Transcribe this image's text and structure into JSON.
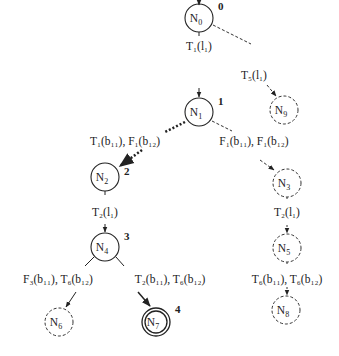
{
  "nodes": [
    {
      "id": "N0",
      "label": "N",
      "sub": "0",
      "step": "0",
      "style": "solid",
      "cx": 199,
      "cy": 18
    },
    {
      "id": "N1",
      "label": "N",
      "sub": "1",
      "step": "1",
      "style": "solid",
      "cx": 199,
      "cy": 112
    },
    {
      "id": "N9",
      "label": "N",
      "sub": "9",
      "step": "",
      "style": "dashed",
      "cx": 284,
      "cy": 110
    },
    {
      "id": "N2",
      "label": "N",
      "sub": "2",
      "step": "2",
      "style": "solid",
      "cx": 105,
      "cy": 177
    },
    {
      "id": "N3",
      "label": "N",
      "sub": "3",
      "step": "",
      "style": "dashed",
      "cx": 287,
      "cy": 183
    },
    {
      "id": "N4",
      "label": "N",
      "sub": "4",
      "step": "3",
      "style": "solid",
      "cx": 105,
      "cy": 247
    },
    {
      "id": "N5",
      "label": "N",
      "sub": "5",
      "step": "",
      "style": "dashed",
      "cx": 287,
      "cy": 248
    },
    {
      "id": "N6",
      "label": "N",
      "sub": "6",
      "step": "",
      "style": "dashed",
      "cx": 59,
      "cy": 322
    },
    {
      "id": "N7",
      "label": "N",
      "sub": "7",
      "step": "4",
      "style": "double",
      "cx": 156,
      "cy": 322
    },
    {
      "id": "N8",
      "label": "N",
      "sub": "8",
      "step": "",
      "style": "dashed",
      "cx": 286,
      "cy": 310
    }
  ],
  "edges": [
    {
      "from": "N0",
      "to": "N1",
      "style": "solid",
      "label": "T₁(l₁)"
    },
    {
      "from": "N0",
      "to": "N9",
      "style": "dashed",
      "label": "T₅(l₁)"
    },
    {
      "from": "N1",
      "to": "N2",
      "style": "dotted",
      "label": "T₁(b₁₁), F₁(b₁₂)"
    },
    {
      "from": "N1",
      "to": "N3",
      "style": "dashed",
      "label": "F₁(b₁₁), F₁(b₁₂)"
    },
    {
      "from": "N2",
      "to": "N4",
      "style": "solid",
      "label": "T₂(l₁)"
    },
    {
      "from": "N3",
      "to": "N5",
      "style": "dashed",
      "label": "T₂(l₁)"
    },
    {
      "from": "N4",
      "to": "N6",
      "style": "solid",
      "label": "F₃(b₁₁), T₆(b₁₂)"
    },
    {
      "from": "N4",
      "to": "N7",
      "style": "solid",
      "label": "T₂(b₁₁), T₆(b₁₂)"
    },
    {
      "from": "N5",
      "to": "N8",
      "style": "dashed",
      "label": "T₆(b₁₁), T₆(b₁₂)"
    }
  ],
  "labels": {
    "e01": "T₁(l₁)",
    "e09": "T₅(l₁)",
    "e12": "T₁(b₁₁), F₁(b₁₂)",
    "e13": "F₁(b₁₁), F₁(b₁₂)",
    "e24": "T₂(l₁)",
    "e35": "T₂(l₁)",
    "e46": "F₃(b₁₁), T₆(b₁₂)",
    "e47": "T₂(b₁₁), T₆(b₁₂)",
    "e58": "T₆(b₁₁), T₆(b₁₂)"
  },
  "node_text": {
    "N0": "N",
    "N0s": "0",
    "N1": "N",
    "N1s": "1",
    "N2": "N",
    "N2s": "2",
    "N3": "N",
    "N3s": "3",
    "N4": "N",
    "N4s": "4",
    "N5": "N",
    "N5s": "5",
    "N6": "N",
    "N6s": "6",
    "N7": "N",
    "N7s": "7",
    "N8": "N",
    "N8s": "8",
    "N9": "N",
    "N9s": "9"
  },
  "steps": {
    "s0": "0",
    "s1": "1",
    "s2": "2",
    "s3": "3",
    "s4": "4"
  },
  "colors": {
    "stroke": "#222222",
    "background": "#ffffff"
  }
}
